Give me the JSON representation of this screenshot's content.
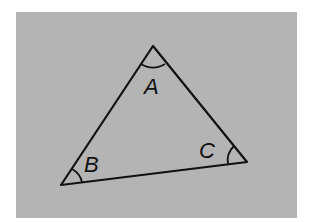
{
  "diagram": {
    "type": "triangle",
    "background_color": "#b4b4b4",
    "stroke_color": "#111111",
    "vertices": [
      {
        "name": "A",
        "label": "A",
        "x": 153,
        "y": 46,
        "label_x": 144,
        "label_y": 94
      },
      {
        "name": "B",
        "label": "B",
        "x": 61,
        "y": 185,
        "label_x": 84,
        "label_y": 172
      },
      {
        "name": "C",
        "label": "C",
        "x": 247,
        "y": 162,
        "label_x": 199,
        "label_y": 158
      }
    ],
    "angle_arcs": [
      "A",
      "B",
      "C"
    ]
  }
}
